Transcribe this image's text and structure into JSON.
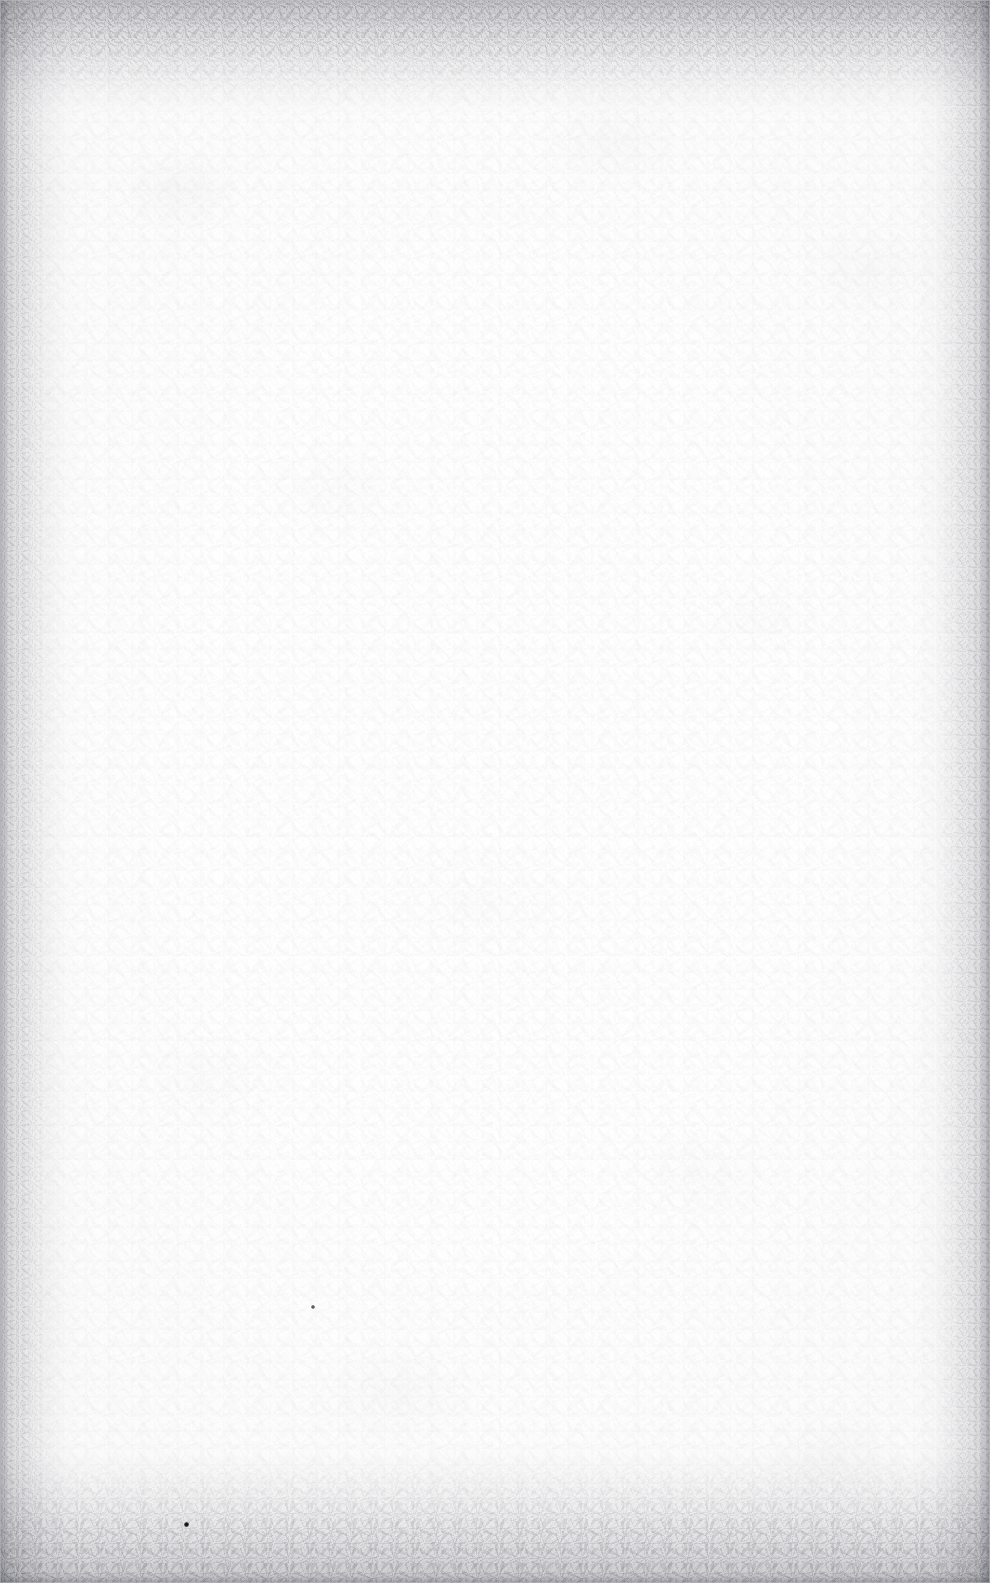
{
  "document": {
    "kind": "scanned-page",
    "content_state": "blank",
    "visible_text": "",
    "page_width_px": 990,
    "page_height_px": 1583
  },
  "appearance": {
    "paper_color": "#fcfcfc",
    "page_background_color": "#ffffff",
    "grain_tone": "#92929a",
    "edge_shadow_color": "#78787f",
    "margin_strip_color": "#cdcdd2",
    "frame_hairline_color": "#bebec4"
  },
  "artifacts": {
    "specks": [
      {
        "name": "dust-speck-lower-left",
        "x": 184,
        "y": 1522,
        "size": 5,
        "tone": "#101014"
      },
      {
        "name": "dust-speck-mid-left",
        "x": 311,
        "y": 1305,
        "size": 4,
        "tone": "#4a4a52"
      }
    ],
    "edge_bands": [
      {
        "name": "top",
        "depth_px": 120
      },
      {
        "name": "bottom",
        "depth_px": 140
      },
      {
        "name": "left",
        "depth_px": 80
      },
      {
        "name": "right",
        "depth_px": 80
      }
    ]
  }
}
